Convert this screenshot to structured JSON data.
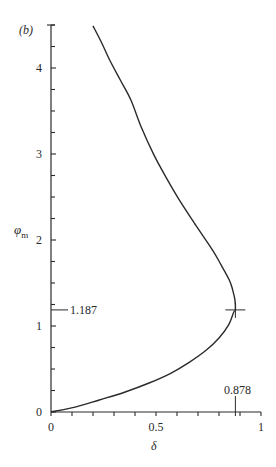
{
  "chart_data": {
    "type": "line",
    "panel_label": "(b)",
    "title": "",
    "xlabel": "δ",
    "ylabel": "φm",
    "xlim": [
      0,
      1
    ],
    "ylim": [
      0,
      4.5
    ],
    "grid": false,
    "x_ticks": [
      0,
      0.5,
      1
    ],
    "x_tick_labels": [
      "0",
      "0.5",
      "1"
    ],
    "x_minor_step": 0.1,
    "y_ticks": [
      0,
      1,
      2,
      3,
      4
    ],
    "y_tick_labels": [
      "0",
      "1",
      "2",
      "3",
      "4"
    ],
    "y_minor_step": 0.25,
    "series": [
      {
        "name": "φm vs δ",
        "points": [
          [
            0.0,
            0.0
          ],
          [
            0.12,
            0.06
          ],
          [
            0.23,
            0.14
          ],
          [
            0.35,
            0.23
          ],
          [
            0.47,
            0.34
          ],
          [
            0.57,
            0.45
          ],
          [
            0.66,
            0.58
          ],
          [
            0.74,
            0.72
          ],
          [
            0.8,
            0.86
          ],
          [
            0.845,
            1.01
          ],
          [
            0.87,
            1.16
          ],
          [
            0.878,
            1.187
          ],
          [
            0.876,
            1.3
          ],
          [
            0.865,
            1.42
          ],
          [
            0.85,
            1.53
          ],
          [
            0.81,
            1.71
          ],
          [
            0.77,
            1.88
          ],
          [
            0.69,
            2.17
          ],
          [
            0.61,
            2.47
          ],
          [
            0.55,
            2.72
          ],
          [
            0.49,
            2.99
          ],
          [
            0.43,
            3.31
          ],
          [
            0.38,
            3.63
          ],
          [
            0.33,
            3.86
          ],
          [
            0.28,
            4.09
          ],
          [
            0.24,
            4.3
          ],
          [
            0.2,
            4.49
          ]
        ]
      }
    ],
    "annotations": [
      {
        "text": "1.187",
        "axis": "y",
        "value": 1.187
      },
      {
        "text": "0.878",
        "axis": "x",
        "value": 0.878
      },
      {
        "type": "cross-marker",
        "x": 0.878,
        "y": 1.187
      }
    ]
  },
  "labels": {
    "panel": "(b)",
    "ylabel_main": "φ",
    "ylabel_sub": "m",
    "xlabel": "δ",
    "y_annot": "1.187",
    "x_annot": "0.878"
  }
}
